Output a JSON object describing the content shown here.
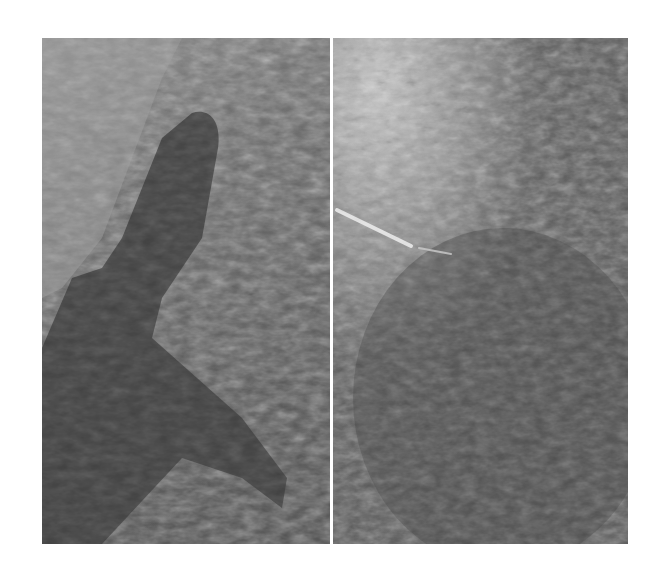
{
  "figure": {
    "panels": [
      {
        "id": "left",
        "description": "Grayscale photograph with a large dark elongated shape over a textured lighter background"
      },
      {
        "id": "right",
        "description": "Grayscale photograph with bright textured upper-left area, a thin bright diagonal line, and dark lower region"
      }
    ],
    "colors": {
      "background": "#ffffff",
      "divider": "#ffffff",
      "dark_region": "#3f3f3f",
      "light_texture": "#b8b8b8"
    }
  }
}
